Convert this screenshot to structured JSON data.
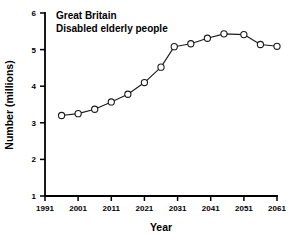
{
  "chart_data": {
    "type": "line",
    "title": "Great Britain",
    "subtitle": "Disabled elderly people",
    "xlabel": "Year",
    "ylabel": "Number (millions)",
    "xlim": [
      1991,
      2061
    ],
    "ylim": [
      1,
      6
    ],
    "xticks": [
      1991,
      2001,
      2011,
      2021,
      2031,
      2041,
      2051,
      2061
    ],
    "xticklabels": [
      "1991",
      "2001",
      "2011",
      "2021",
      "2031",
      "2041",
      "2051",
      "2061"
    ],
    "yticks": [
      1,
      2,
      3,
      4,
      5,
      6
    ],
    "yticklabels": [
      "1",
      "2",
      "3",
      "4",
      "5",
      "6"
    ],
    "grid": false,
    "legend": "none",
    "marker": "open-circle",
    "series": [
      {
        "name": "Disabled elderly people",
        "x": [
          1996,
          2001,
          2006,
          2011,
          2016,
          2021,
          2026,
          2030,
          2035,
          2040,
          2045,
          2051,
          2056,
          2061
        ],
        "values": [
          3.2,
          3.25,
          3.37,
          3.57,
          3.78,
          4.1,
          4.52,
          5.08,
          5.16,
          5.31,
          5.43,
          5.41,
          5.14,
          5.09
        ]
      }
    ]
  },
  "colors": {
    "axis": "#000000",
    "line": "#1a1a1a",
    "marker_fill": "#ffffff",
    "background": "#ffffff"
  }
}
